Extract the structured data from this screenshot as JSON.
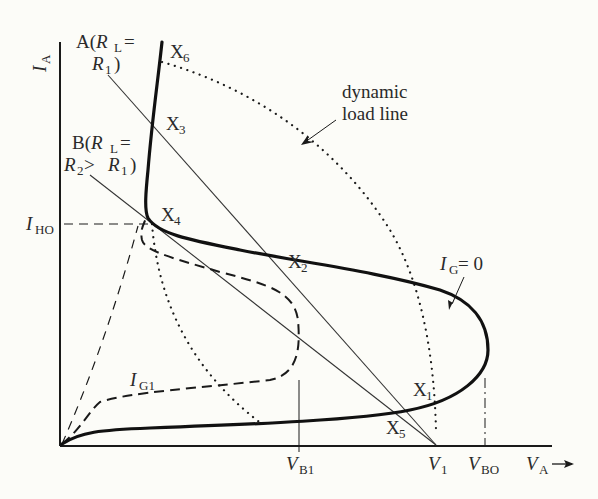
{
  "diagram": {
    "type": "thyristor I-V characteristic with load lines",
    "axes": {
      "y_label": "I",
      "y_label_sub": "A",
      "x_label": "V",
      "x_label_sub": "A",
      "x_arrow": "→"
    },
    "x_ticks": [
      {
        "main": "V",
        "sub": "B1"
      },
      {
        "main": "V",
        "sub": "1"
      },
      {
        "main": "V",
        "sub": "BO"
      }
    ],
    "y_ticks": [
      {
        "main": "I",
        "sub": "HO"
      }
    ],
    "load_line_a": {
      "line1_prefix": "A(",
      "line1_var": "R",
      "line1_sub": "L",
      "line1_suffix": " =",
      "line2_var": "R",
      "line2_sub": "1",
      "line2_suffix": ")"
    },
    "load_line_b": {
      "line1_prefix": "B(",
      "line1_var": "R",
      "line1_sub": "L",
      "line1_suffix": " =",
      "line2_var": "R",
      "line2_sub": "2",
      "line2_mid": " > ",
      "line2_var2": "R",
      "line2_sub2": "1",
      "line2_suffix": ")"
    },
    "dynamic_load_line": {
      "line1": "dynamic",
      "line2": "load line"
    },
    "curve_ig0": {
      "var": "I",
      "sub": "G",
      "suffix": " = 0"
    },
    "curve_ig1": {
      "var": "I",
      "sub": "G1"
    },
    "points": [
      {
        "main": "X",
        "sub": "1"
      },
      {
        "main": "X",
        "sub": "2"
      },
      {
        "main": "X",
        "sub": "3"
      },
      {
        "main": "X",
        "sub": "4"
      },
      {
        "main": "X",
        "sub": "5"
      },
      {
        "main": "X",
        "sub": "6"
      }
    ],
    "colors": {
      "ink": "#1a1a1a",
      "background": "#fcfcf8"
    }
  }
}
